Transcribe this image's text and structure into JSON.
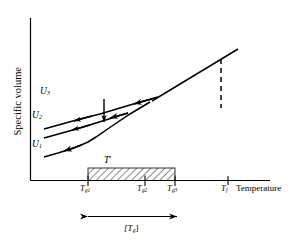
{
  "figure": {
    "name": "specific-volume-vs-temperature-glass-transition-diagram",
    "background_color": "#ffffff",
    "line_color": "#000000"
  },
  "axes": {
    "y_label": "Specific volume",
    "x_label": "Temperature",
    "x_ticks": [
      {
        "id": "tg1",
        "label_base": "T",
        "label_sub": "g1",
        "x": 88
      },
      {
        "id": "tg2",
        "label_base": "T",
        "label_sub": "g2",
        "x": 145
      },
      {
        "id": "tg3",
        "label_base": "T",
        "label_sub": "g3",
        "x": 175
      },
      {
        "id": "tf",
        "label_base": "T",
        "label_sub": "f",
        "x": 228
      }
    ]
  },
  "curves": [
    {
      "id": "u1",
      "label_base": "U",
      "label_sub": "1",
      "description": "lowest cooling curve, glass line meets liquid line at lowest transition",
      "arrow_direction": "left"
    },
    {
      "id": "u2",
      "label_base": "U",
      "label_sub": "2",
      "description": "middle cooling curve, intermediate glass transition",
      "arrow_direction": "left"
    },
    {
      "id": "u3",
      "label_base": "U",
      "label_sub": "3",
      "description": "uppermost cooling curve, highest glass transition",
      "arrow_direction": "left"
    }
  ],
  "annotations": {
    "t_prime_label_base": "T",
    "t_prime_label_prime": "′",
    "tg_range_label": "[T",
    "tg_range_label_sub": "g",
    "tg_range_label_close": "]",
    "hatched_band": {
      "name": "t-prime-hatched-band",
      "from_tick": "tg1",
      "to_tick": "tg3"
    },
    "relaxation_arrow": {
      "name": "structural-relaxation-arrow",
      "direction": "down"
    },
    "dashed_line": {
      "name": "tf-dashed-line",
      "at_tick": "tf"
    }
  }
}
